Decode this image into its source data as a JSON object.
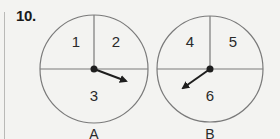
{
  "problem": {
    "number": "10."
  },
  "spinners": [
    {
      "label": "A",
      "sections": [
        "1",
        "2",
        "3"
      ],
      "pointer_points_to": "3"
    },
    {
      "label": "B",
      "sections": [
        "4",
        "5",
        "6"
      ],
      "pointer_points_to": "6"
    }
  ],
  "colors": {
    "background": "#f3f3f1",
    "circle_stroke": "#7a7a7a",
    "arrow": "#1e1e1e",
    "text": "#2a2a2a"
  }
}
